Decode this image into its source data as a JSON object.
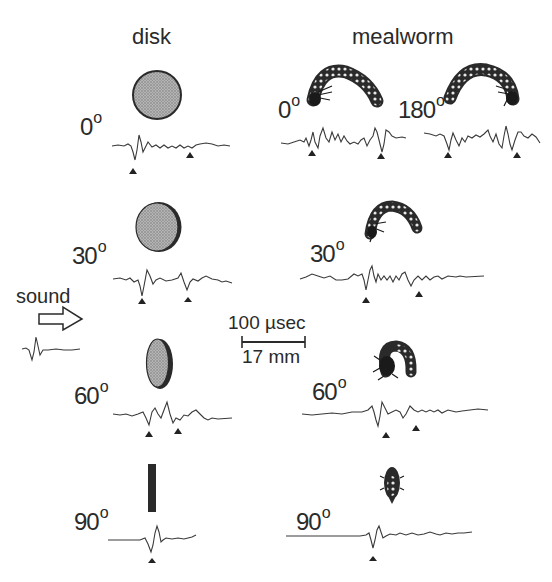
{
  "columns": {
    "disk": "disk",
    "mealworm": "mealworm"
  },
  "degree_symbol": "o",
  "disk_rows": [
    {
      "angle": "0",
      "shape": "circle"
    },
    {
      "angle": "30",
      "shape": "ellipse"
    },
    {
      "angle": "60",
      "shape": "narrow-ellipse"
    },
    {
      "angle": "90",
      "shape": "bar"
    }
  ],
  "mealworm_rows": [
    {
      "angle": "0"
    },
    {
      "angle": "180"
    },
    {
      "angle": "30"
    },
    {
      "angle": "60"
    },
    {
      "angle": "90"
    }
  ],
  "sound": {
    "label": "sound"
  },
  "scale_bar": {
    "time": "100 µsec",
    "distance": "17 mm"
  },
  "colors": {
    "ink": "#2a2a2a",
    "fill": "#a8a8a8",
    "background": "#ffffff"
  }
}
